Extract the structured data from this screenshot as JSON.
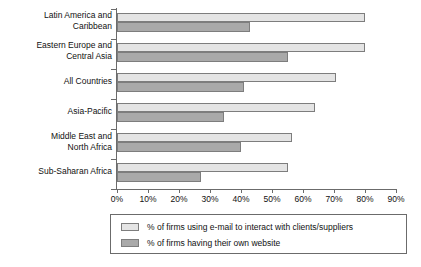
{
  "chart_data": {
    "type": "bar",
    "orientation": "horizontal",
    "title": "",
    "xlabel": "",
    "ylabel": "",
    "xlim": [
      0,
      90
    ],
    "grid": false,
    "legend_position": "bottom",
    "categories": [
      "Latin America and\nCaribbean",
      "Eastern Europe and\nCentral Asia",
      "All Countries",
      "Asia-Pacific",
      "Middle East and\nNorth Africa",
      "Sub-Saharan Africa"
    ],
    "tick_labels": [
      "0%",
      "10%",
      "20%",
      "30%",
      "40%",
      "50%",
      "60%",
      "70%",
      "80%",
      "90%"
    ],
    "tick_values": [
      0,
      10,
      20,
      30,
      40,
      50,
      60,
      70,
      80,
      90
    ],
    "series": [
      {
        "name": "% of firms using e-mail to interact with clients/suppliers",
        "color": "#e4e4e4",
        "values": [
          80,
          80,
          70.5,
          64,
          56.5,
          55
        ]
      },
      {
        "name": "% of firms having their own website",
        "color": "#a9a9a9",
        "values": [
          43,
          55,
          41,
          34.5,
          40,
          27
        ]
      }
    ]
  },
  "legend": {
    "items": [
      {
        "label": "% of firms using e-mail to interact with clients/suppliers"
      },
      {
        "label": "% of firms having their own website"
      }
    ]
  }
}
